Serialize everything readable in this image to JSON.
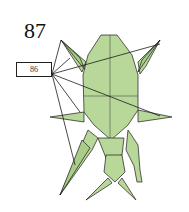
{
  "diagram": {
    "step_number": "87",
    "reference_label": "86",
    "colors": {
      "paper_fill": "#b8d89a",
      "paper_fill_light": "#c5e0ab",
      "line": "#1a1a1a",
      "background": "#ffffff"
    }
  }
}
